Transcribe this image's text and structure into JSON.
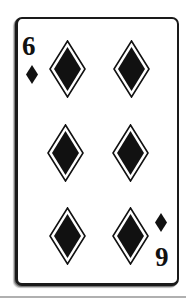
{
  "card": {
    "rank": "6",
    "suit": "diamonds",
    "suit_icon": "diamond-icon",
    "index_top": "6",
    "index_bottom": "6",
    "pip_count": 6,
    "colors": {
      "ink": "#111111",
      "border": "#1a1a1a",
      "face": "#ffffff",
      "shadow": "#7a7a7a"
    }
  }
}
